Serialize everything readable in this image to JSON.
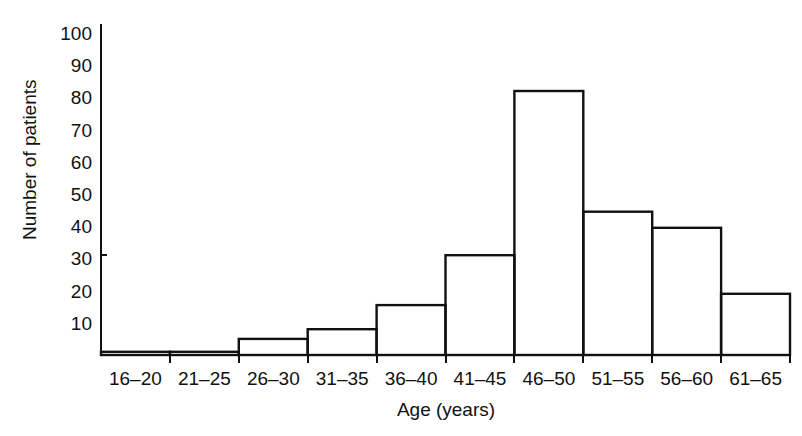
{
  "chart_data": {
    "type": "bar",
    "title": "",
    "subtitle": "",
    "xlabel": "Age (years)",
    "ylabel": "Number of patients",
    "categories": [
      "16–20",
      "21–25",
      "26–30",
      "31–35",
      "36–40",
      "41–45",
      "46–50",
      "51–55",
      "56–60",
      "61–65"
    ],
    "values": [
      1,
      1,
      5,
      8,
      15.5,
      31,
      82,
      44.5,
      39.5,
      19
    ],
    "ylim": [
      0,
      100
    ],
    "ytick_labels": [
      "10",
      "20",
      "30",
      "40",
      "50",
      "60",
      "70",
      "80",
      "90",
      "100"
    ],
    "ytick_values": [
      10,
      20,
      30,
      40,
      50,
      60,
      70,
      80,
      90,
      100
    ],
    "grid": false,
    "legend": false,
    "style": {
      "bar_fill": "#ffffff",
      "bar_stroke": "#111111",
      "axis_color": "#111111",
      "background": "#ffffff"
    }
  }
}
